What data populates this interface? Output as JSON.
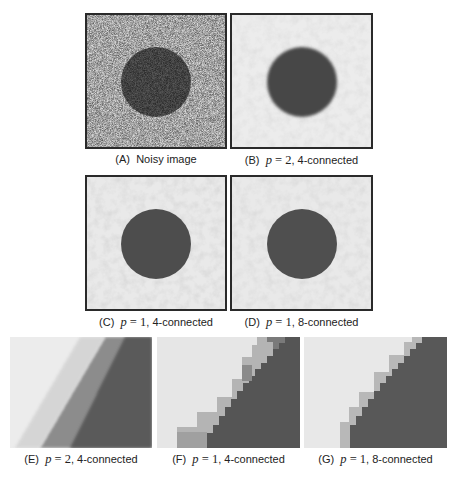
{
  "figure": {
    "panels": [
      {
        "id": "A",
        "label": "(A)",
        "caption": "Noisy image",
        "param": "",
        "connectivity": ""
      },
      {
        "id": "B",
        "label": "(B)",
        "param_var": "p",
        "param_eq": " = ",
        "param_val": "2",
        "connectivity": ", 4-connected"
      },
      {
        "id": "C",
        "label": "(C)",
        "param_var": "p",
        "param_eq": " = ",
        "param_val": "1",
        "connectivity": ", 4-connected"
      },
      {
        "id": "D",
        "label": "(D)",
        "param_var": "p",
        "param_eq": " = ",
        "param_val": "1",
        "connectivity": ", 8-connected"
      },
      {
        "id": "E",
        "label": "(E)",
        "param_var": "p",
        "param_eq": " = ",
        "param_val": "2",
        "connectivity": ", 4-connected"
      },
      {
        "id": "F",
        "label": "(F)",
        "param_var": "p",
        "param_eq": " = ",
        "param_val": "1",
        "connectivity": ", 4-connected"
      },
      {
        "id": "G",
        "label": "(G)",
        "param_var": "p",
        "param_eq": " = ",
        "param_val": "1",
        "connectivity": ", 8-connected"
      }
    ],
    "colors": {
      "background_light": "#e6e6e6",
      "disk_dark": "#4a4a4a",
      "frame": "#2a2a2a"
    }
  }
}
